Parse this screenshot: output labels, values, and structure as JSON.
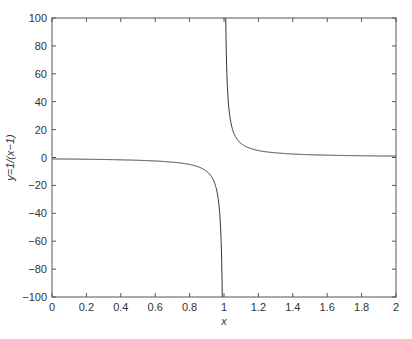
{
  "chart_data": {
    "type": "line",
    "title": "",
    "xlabel": "x",
    "ylabel": "y=1/(x−1)",
    "xlim": [
      0,
      2
    ],
    "ylim": [
      -100,
      100
    ],
    "grid": false,
    "legend": null,
    "x_ticks": [
      0,
      0.2,
      0.4,
      0.6,
      0.8,
      1,
      1.2,
      1.4,
      1.6,
      1.8,
      2
    ],
    "x_tick_labels": [
      "0",
      "0.2",
      "0.4",
      "0.6",
      "0.8",
      "1",
      "1.2",
      "1.4",
      "1.6",
      "1.8",
      "2"
    ],
    "y_ticks": [
      -100,
      -80,
      -60,
      -40,
      -20,
      0,
      20,
      40,
      60,
      80,
      100
    ],
    "y_tick_labels": [
      "−100",
      "−80",
      "−60",
      "−40",
      "−20",
      "0",
      "20",
      "40",
      "60",
      "80",
      "100"
    ],
    "series": [
      {
        "name": "y=1/(x-1)",
        "function": "1/(x-1)",
        "color": "#333333",
        "x": [
          0,
          0.2,
          0.4,
          0.6,
          0.8,
          0.9,
          0.95,
          0.98,
          0.99,
          1.01,
          1.02,
          1.05,
          1.1,
          1.2,
          1.4,
          1.6,
          1.8,
          2
        ],
        "y": [
          -1,
          -1.25,
          -1.67,
          -2.5,
          -5,
          -10,
          -20,
          -50,
          -100,
          100,
          50,
          20,
          10,
          5,
          2.5,
          1.67,
          1.25,
          1
        ]
      }
    ]
  },
  "colors": {
    "axis": "#555555",
    "line": "#333333",
    "background": "#ffffff"
  }
}
